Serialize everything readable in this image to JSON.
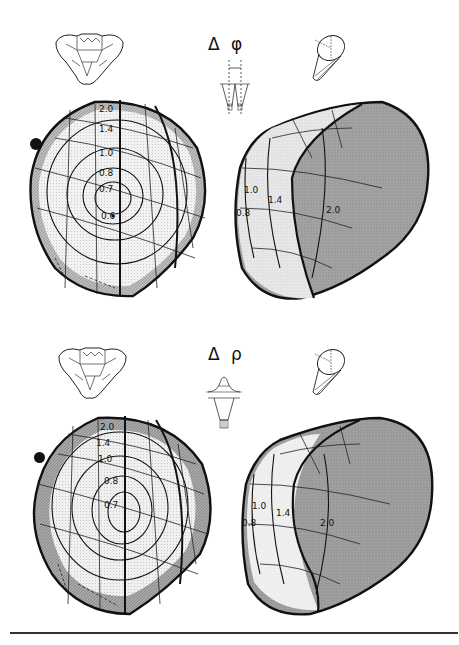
{
  "figure": {
    "panels": [
      {
        "id": "delta-phi",
        "symbol": "Δ φ",
        "frontal_view": {
          "contour_labels": [
            "2.0",
            "1.4",
            "1.0",
            "0.8",
            "0.7",
            "0.6"
          ],
          "marker": "filled-dot"
        },
        "lateral_view": {
          "contour_labels": [
            "1.0",
            "0.8",
            "1.4",
            "2.0"
          ]
        }
      },
      {
        "id": "delta-rho",
        "symbol": "Δ ρ",
        "frontal_view": {
          "contour_labels": [
            "2.0",
            "1.4",
            "1.0",
            "0.8",
            "0.7"
          ],
          "marker": "filled-dot"
        },
        "lateral_view": {
          "contour_labels": [
            "1.0",
            "0.8",
            "1.4",
            "2.0"
          ]
        }
      }
    ],
    "colors": {
      "ink": "#111111",
      "light_fill": "#ececec",
      "mid_fill": "#c8c8c8",
      "dark_fill": "#9a9a9a",
      "rule": "#333333"
    }
  }
}
